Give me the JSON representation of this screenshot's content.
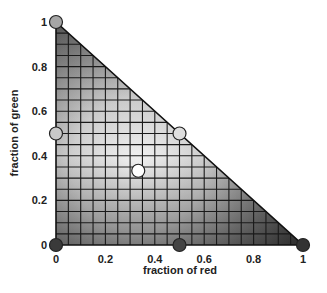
{
  "chart_data": {
    "type": "scatter",
    "subtype": "ternary-simplex-right-triangle",
    "title": "",
    "xlabel": "fraction of red",
    "ylabel": "fraction of green",
    "xlim": [
      0,
      1
    ],
    "ylim": [
      0,
      1
    ],
    "x_ticks": [
      "0",
      "0.2",
      "0.4",
      "0.6",
      "0.8",
      "1"
    ],
    "y_ticks": [
      "0",
      "0.2",
      "0.4",
      "0.6",
      "0.8",
      "1"
    ],
    "grid": {
      "on": true,
      "divisions": 20,
      "step": 0.05
    },
    "region": "triangle with vertices (0,0), (1,0), (0,1) shaded in grayscale gradient, lightest near center (1/3,1/3), darker toward bottom edge",
    "points": [
      {
        "x": 0.0,
        "y": 1.0,
        "shade": "medium-gray",
        "color": "#a6a6a6"
      },
      {
        "x": 0.0,
        "y": 0.5,
        "shade": "light-gray",
        "color": "#c8c8c8"
      },
      {
        "x": 0.5,
        "y": 0.5,
        "shade": "very-light-gray",
        "color": "#dedede"
      },
      {
        "x": 0.333,
        "y": 0.333,
        "shade": "white",
        "color": "#ffffff"
      },
      {
        "x": 0.0,
        "y": 0.0,
        "shade": "dark-gray",
        "color": "#3a3a3a"
      },
      {
        "x": 0.5,
        "y": 0.0,
        "shade": "dark-gray",
        "color": "#444444"
      },
      {
        "x": 1.0,
        "y": 0.0,
        "shade": "dark-gray",
        "color": "#333333"
      }
    ]
  }
}
